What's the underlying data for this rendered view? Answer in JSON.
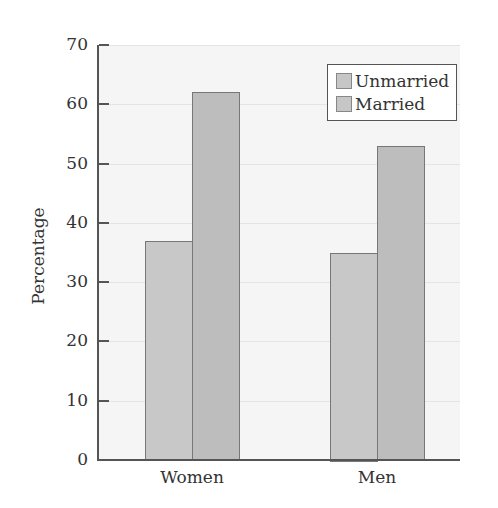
{
  "chart_data": {
    "type": "bar",
    "title": "",
    "xlabel": "",
    "ylabel": "Percentage",
    "categories": [
      "Women",
      "Men"
    ],
    "series": [
      {
        "name": "Unmarried",
        "values": [
          37,
          35
        ],
        "color": "#c8c8c8"
      },
      {
        "name": "Married",
        "values": [
          62,
          53
        ],
        "color": "#bdbdbd"
      }
    ],
    "ylim": [
      0,
      70
    ],
    "yticks": [
      0,
      10,
      20,
      30,
      40,
      50,
      60,
      70
    ],
    "grid": true,
    "legend_position": "upper right"
  },
  "axis": {
    "ylabel": "Percentage",
    "ticks": [
      "0",
      "10",
      "20",
      "30",
      "40",
      "50",
      "60",
      "70"
    ]
  },
  "legend": {
    "items": [
      "Unmarried",
      "Married"
    ]
  },
  "categories": [
    "Women",
    "Men"
  ]
}
